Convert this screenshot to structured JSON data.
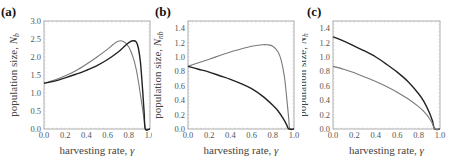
{
  "figure": {
    "panels": [
      {
        "label": "(a)",
        "ylabel_text": "population size, ",
        "ylabel_sym": "N",
        "ylabel_sub": "b",
        "xlabel_text": "harvesting rate, ",
        "xlabel_sym": "γ"
      },
      {
        "label": "(b)",
        "ylabel_text": "population size, ",
        "ylabel_sym": "N",
        "ylabel_sub": "nb",
        "xlabel_text": "harvesting rate, ",
        "xlabel_sym": "γ"
      },
      {
        "label": "(c)",
        "ylabel_text": "population size, ",
        "ylabel_sym": "N",
        "ylabel_sub": "h",
        "xlabel_text": "harvesting rate, ",
        "xlabel_sym": "γ"
      }
    ],
    "colors": {
      "black_curve": "#222222",
      "gray_curve": "#7a7a7a",
      "frame": "#999999",
      "text": "#555555"
    }
  },
  "chart_data": [
    {
      "type": "line",
      "title": "(a)",
      "xlabel": "harvesting rate, γ",
      "ylabel": "population size, N_b",
      "xlim": [
        0,
        1
      ],
      "ylim": [
        0,
        3
      ],
      "xticks": [
        "0.0",
        "0.2",
        "0.4",
        "0.6",
        "0.8",
        "1.0"
      ],
      "yticks": [
        "0.0",
        "0.5",
        "1.0",
        "1.5",
        "2.0",
        "2.5",
        "3.0"
      ],
      "series": [
        {
          "name": "gray",
          "color": "#7a7a7a",
          "x": [
            0,
            0.1,
            0.2,
            0.3,
            0.4,
            0.5,
            0.6,
            0.65,
            0.7,
            0.75,
            0.8,
            0.85,
            0.88,
            0.91,
            0.93,
            0.95,
            0.96,
            1.0
          ],
          "y": [
            1.27,
            1.36,
            1.48,
            1.62,
            1.8,
            2.0,
            2.22,
            2.34,
            2.44,
            2.43,
            2.28,
            1.9,
            1.5,
            0.95,
            0.55,
            0.15,
            0,
            0
          ]
        },
        {
          "name": "black",
          "color": "#222222",
          "x": [
            0,
            0.1,
            0.2,
            0.3,
            0.4,
            0.5,
            0.6,
            0.7,
            0.75,
            0.8,
            0.84,
            0.87,
            0.89,
            0.91,
            0.93,
            0.945,
            0.955,
            1.0
          ],
          "y": [
            1.27,
            1.33,
            1.42,
            1.52,
            1.63,
            1.76,
            1.93,
            2.14,
            2.27,
            2.4,
            2.45,
            2.42,
            2.25,
            1.85,
            1.1,
            0.45,
            0,
            0
          ]
        }
      ]
    },
    {
      "type": "line",
      "title": "(b)",
      "xlabel": "harvesting rate, γ",
      "ylabel": "population size, N_nb",
      "xlim": [
        0,
        1
      ],
      "ylim": [
        0,
        1.5
      ],
      "xticks": [
        "0.0",
        "0.2",
        "0.4",
        "0.6",
        "0.8",
        "1.0"
      ],
      "yticks": [
        "0.0",
        "0.2",
        "0.4",
        "0.6",
        "0.8",
        "1.0",
        "1.2",
        "1.4"
      ],
      "series": [
        {
          "name": "gray",
          "color": "#7a7a7a",
          "x": [
            0,
            0.1,
            0.2,
            0.3,
            0.4,
            0.5,
            0.6,
            0.7,
            0.75,
            0.8,
            0.85,
            0.88,
            0.91,
            0.93,
            0.95,
            0.96,
            1.0
          ],
          "y": [
            0.87,
            0.92,
            0.97,
            1.02,
            1.07,
            1.11,
            1.15,
            1.17,
            1.17,
            1.15,
            1.07,
            0.95,
            0.72,
            0.45,
            0.15,
            0,
            0
          ]
        },
        {
          "name": "black",
          "color": "#222222",
          "x": [
            0,
            0.1,
            0.2,
            0.3,
            0.4,
            0.5,
            0.6,
            0.7,
            0.8,
            0.85,
            0.9,
            0.93,
            0.95,
            1.0
          ],
          "y": [
            0.87,
            0.83,
            0.79,
            0.74,
            0.69,
            0.63,
            0.56,
            0.46,
            0.33,
            0.25,
            0.14,
            0.06,
            0,
            0
          ]
        }
      ]
    },
    {
      "type": "line",
      "title": "(c)",
      "xlabel": "harvesting rate, γ",
      "ylabel": "population size, N_h",
      "xlim": [
        0,
        1
      ],
      "ylim": [
        0,
        1.5
      ],
      "xticks": [
        "0.0",
        "0.2",
        "0.4",
        "0.6",
        "0.8",
        "1.0"
      ],
      "yticks": [
        "0.0",
        "0.2",
        "0.4",
        "0.6",
        "0.8",
        "1.0",
        "1.2",
        "1.4"
      ],
      "series": [
        {
          "name": "black",
          "color": "#222222",
          "x": [
            0,
            0.1,
            0.2,
            0.3,
            0.4,
            0.5,
            0.6,
            0.7,
            0.8,
            0.85,
            0.9,
            0.93,
            0.95,
            1.0
          ],
          "y": [
            1.28,
            1.22,
            1.15,
            1.08,
            1.0,
            0.9,
            0.79,
            0.66,
            0.49,
            0.38,
            0.23,
            0.11,
            0,
            0
          ]
        },
        {
          "name": "gray",
          "color": "#7a7a7a",
          "x": [
            0,
            0.1,
            0.2,
            0.3,
            0.4,
            0.5,
            0.6,
            0.7,
            0.8,
            0.85,
            0.9,
            0.93,
            0.95,
            1.0
          ],
          "y": [
            0.87,
            0.83,
            0.78,
            0.72,
            0.66,
            0.59,
            0.51,
            0.42,
            0.31,
            0.24,
            0.15,
            0.07,
            0,
            0
          ]
        }
      ]
    }
  ]
}
